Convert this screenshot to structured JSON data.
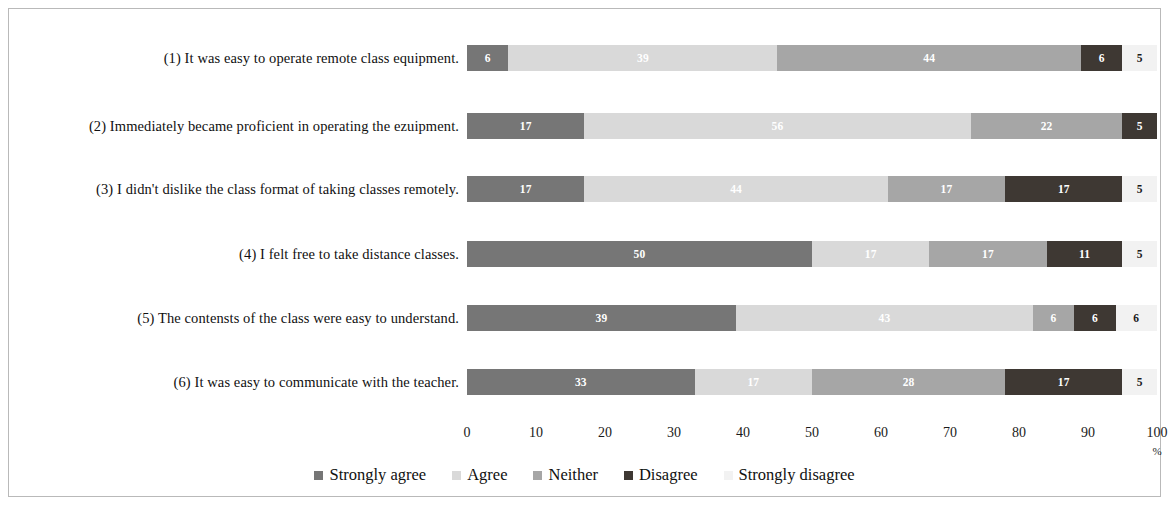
{
  "chart_data": {
    "type": "bar",
    "orientation": "horizontal",
    "stacked": true,
    "stack_mode": "percent",
    "title": "",
    "xlabel": "%",
    "ylabel": "",
    "xlim": [
      0,
      100
    ],
    "xticks": [
      "0",
      "10",
      "20",
      "30",
      "40",
      "50",
      "60",
      "70",
      "80",
      "90",
      "100"
    ],
    "grid": false,
    "legend_position": "bottom",
    "categories": [
      "(1)  It was easy to operate remote class equipment.",
      "(2) Immediately became proficient in operating the ezuipment.",
      "(3) I didn't dislike the class format of taking classes remotely.",
      "(4) I felt free to take distance classes.",
      "(5) The contensts of the class were easy to understand.",
      "(6)  It was easy to communicate with the  teacher."
    ],
    "series": [
      {
        "name": "Strongly agree",
        "color": "#767676",
        "values": [
          6,
          17,
          17,
          50,
          39,
          33
        ]
      },
      {
        "name": "Agree",
        "color": "#d9d9d9",
        "values": [
          39,
          56,
          44,
          17,
          43,
          17
        ]
      },
      {
        "name": "Neither",
        "color": "#a6a6a6",
        "values": [
          44,
          22,
          17,
          17,
          6,
          28
        ]
      },
      {
        "name": "Disagree",
        "color": "#3e3833",
        "values": [
          6,
          5,
          17,
          11,
          6,
          17
        ]
      },
      {
        "name": "Strongly disagree",
        "color": "#f2f2f2",
        "values": [
          5,
          0,
          5,
          5,
          6,
          5
        ]
      }
    ],
    "bar_labels": [
      [
        "6",
        "39",
        "44",
        "6",
        "5"
      ],
      [
        "17",
        "56",
        "22",
        "5",
        "0"
      ],
      [
        "17",
        "44",
        "17",
        "17",
        "5"
      ],
      [
        "50",
        "17",
        "17",
        "11",
        "5"
      ],
      [
        "39",
        "43",
        "6",
        "6",
        "6"
      ],
      [
        "33",
        "17",
        "28",
        "17",
        "5"
      ]
    ]
  }
}
